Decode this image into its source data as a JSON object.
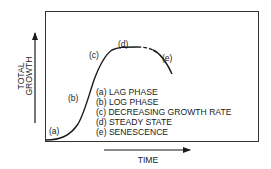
{
  "diagram": {
    "y_axis_label_lines": [
      "TOTAL",
      "GROWTH"
    ],
    "x_axis_label": "TIME",
    "phase_markers": [
      {
        "id": "a",
        "label": "(a)"
      },
      {
        "id": "b",
        "label": "(b)"
      },
      {
        "id": "c",
        "label": "(c)"
      },
      {
        "id": "d",
        "label": "(d)"
      },
      {
        "id": "e",
        "label": "(e)"
      }
    ],
    "legend": [
      {
        "id": "a",
        "text": "(a) LAG PHASE"
      },
      {
        "id": "b",
        "text": "(b) LOG PHASE"
      },
      {
        "id": "c",
        "text": "(c) DECREASING GROWTH RATE"
      },
      {
        "id": "d",
        "text": "(d) STEADY STATE"
      },
      {
        "id": "e",
        "text": "(e) SENESCENCE"
      }
    ],
    "colors": {
      "line": "#1a1a1a",
      "background": "#ffffff"
    }
  }
}
